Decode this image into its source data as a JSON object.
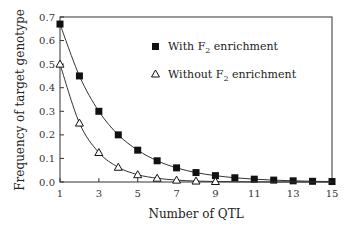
{
  "chart_data": {
    "type": "line",
    "title": "",
    "xlabel": "Number of QTL",
    "ylabel": "Frequency of target genotype",
    "xlim": [
      1,
      15
    ],
    "ylim": [
      0.0,
      0.7
    ],
    "x": [
      1,
      2,
      3,
      4,
      5,
      6,
      7,
      8,
      9,
      10,
      11,
      12,
      13,
      14,
      15
    ],
    "x_ticks": [
      "1",
      "3",
      "5",
      "7",
      "9",
      "11",
      "13",
      "15"
    ],
    "y_ticks": [
      "0.0",
      "0.1",
      "0.2",
      "0.3",
      "0.4",
      "0.5",
      "0.6",
      "0.7"
    ],
    "grid": false,
    "legend_position": "upper right (inside)",
    "series": [
      {
        "name": "With F2 enrichment",
        "marker": "filled-square",
        "values": [
          0.67,
          0.45,
          0.3,
          0.2,
          0.135,
          0.09,
          0.06,
          0.04,
          0.027,
          0.018,
          0.012,
          0.008,
          0.005,
          0.003,
          0.002
        ]
      },
      {
        "name": "Without F2 enrichment",
        "marker": "open-triangle",
        "values": [
          0.5,
          0.25,
          0.125,
          0.0625,
          0.031,
          0.016,
          0.008,
          0.004,
          0.002,
          0.001,
          0.0005,
          0.0002,
          0.0001,
          0.0001,
          0.0
        ]
      }
    ]
  },
  "legend": {
    "with_label": "With F",
    "without_label": "Without F",
    "subscript": "2",
    "suffix": " enrichment"
  }
}
